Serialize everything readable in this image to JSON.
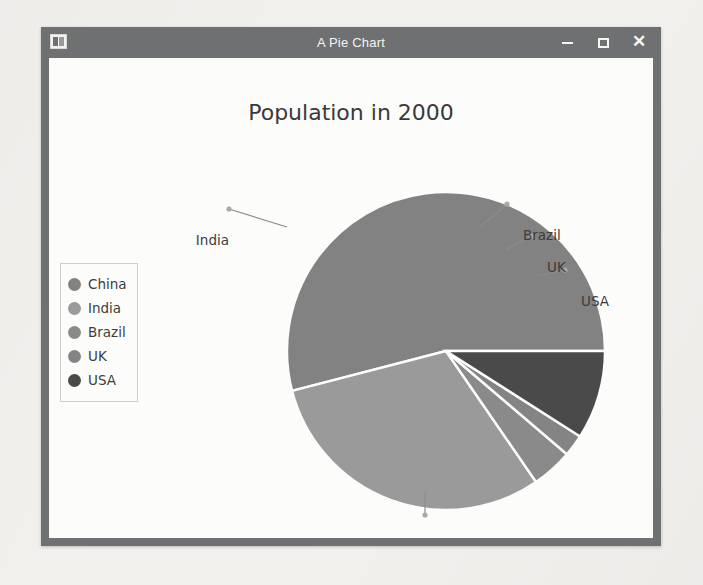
{
  "window": {
    "title": "A Pie Chart",
    "icon": "app-window-icon",
    "controls": {
      "minimize": "minimize-icon",
      "maximize": "maximize-icon",
      "close": "close-icon"
    }
  },
  "chart_data": {
    "type": "pie",
    "title": "Population in 2000",
    "categories": [
      "China",
      "India",
      "Brazil",
      "UK",
      "USA"
    ],
    "values": [
      54.0,
      30.6,
      4.2,
      2.2,
      9.0
    ],
    "units": "percent of total",
    "start_angle_deg": 0,
    "direction": "counterclockwise",
    "slice_angles_deg": [
      {
        "name": "China",
        "start": 0,
        "end": 194.5
      },
      {
        "name": "India",
        "start": 194.5,
        "end": 304.5
      },
      {
        "name": "Brazil",
        "start": 304.5,
        "end": 319.5
      },
      {
        "name": "UK",
        "start": 319.5,
        "end": 327.5
      },
      {
        "name": "USA",
        "start": 327.5,
        "end": 360
      }
    ],
    "colors": [
      "#828282",
      "#9a9a9a",
      "#8a8a8a",
      "#848484",
      "#4a4a4a"
    ],
    "labels_shown": [
      "China",
      "India",
      "Brazil",
      "UK",
      "USA"
    ],
    "legend_entries": [
      "China",
      "India",
      "Brazil",
      "UK",
      "USA"
    ],
    "legend_position": "left",
    "grid": false,
    "xlabel": "",
    "ylabel": ""
  },
  "legend": {
    "items": [
      {
        "label": "China",
        "color": "#828282"
      },
      {
        "label": "India",
        "color": "#9a9a9a"
      },
      {
        "label": "Brazil",
        "color": "#8a8a8a"
      },
      {
        "label": "UK",
        "color": "#848484"
      },
      {
        "label": "USA",
        "color": "#4a4a4a"
      }
    ]
  },
  "callouts": {
    "india": "India",
    "brazil": "Brazil",
    "uk": "UK",
    "usa": "USA",
    "china": "China"
  }
}
